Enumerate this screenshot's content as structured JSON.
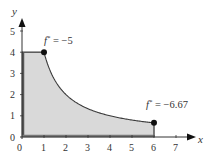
{
  "chart_data": {
    "type": "area",
    "title": "",
    "xlabel": "x",
    "ylabel": "y",
    "xlim": [
      0,
      7
    ],
    "ylim": [
      0,
      5
    ],
    "x_ticks": [
      "0",
      "1",
      "2",
      "3",
      "4",
      "5",
      "6",
      "7"
    ],
    "y_ticks": [
      "0",
      "1",
      "2",
      "3",
      "4",
      "5"
    ],
    "grid": false,
    "region": {
      "description": "Shaded feasible region bounded by x=0, y=0, y=4 (0<=x<=1), curve y=4/x (1<=x<=6), and x=6",
      "boundary": [
        [
          0,
          0
        ],
        [
          0,
          4
        ],
        [
          1,
          4
        ],
        [
          1.5,
          2.67
        ],
        [
          2,
          2
        ],
        [
          3,
          1.33
        ],
        [
          4,
          1
        ],
        [
          5,
          0.8
        ],
        [
          6,
          0.67
        ],
        [
          6,
          0
        ]
      ],
      "fill_color": "#d9d9d9",
      "edge_color": "#333333"
    },
    "points": [
      {
        "x": 1,
        "y": 4,
        "label": "f* = -5"
      },
      {
        "x": 6,
        "y": 0.67,
        "label": "f* = -6.67"
      }
    ],
    "annotations": [
      {
        "text_main": "f",
        "text_sup": "*",
        "text_rest": " = −5",
        "x": 1,
        "y": 4
      },
      {
        "text_main": "f",
        "text_sup": "*",
        "text_rest": " = −6.67",
        "x": 6,
        "y": 0.67
      }
    ]
  }
}
